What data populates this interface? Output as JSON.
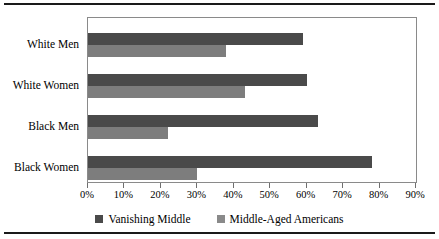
{
  "chart_data": {
    "type": "bar",
    "orientation": "horizontal",
    "title": "",
    "subtitle": "",
    "xlabel": "",
    "ylabel": "",
    "categories": [
      "White Men",
      "White Women",
      "Black Men",
      "Black Women"
    ],
    "series": [
      {
        "name": "Vanishing Middle",
        "color": "#4a4a4a",
        "values": [
          59,
          60,
          63,
          78
        ]
      },
      {
        "name": "Middle-Aged Americans",
        "color": "#7d7d7d",
        "values": [
          38,
          43,
          22,
          30
        ]
      }
    ],
    "xlim": [
      0,
      90
    ],
    "xticks": [
      0,
      10,
      20,
      30,
      40,
      50,
      60,
      70,
      80,
      90
    ],
    "xtick_labels": [
      "0%",
      "10%",
      "20%",
      "30%",
      "40%",
      "50%",
      "60%",
      "70%",
      "80%",
      "90%"
    ],
    "grid": false,
    "legend_position": "bottom",
    "legend": [
      {
        "label": "Vanishing Middle",
        "color": "#4a4a4a"
      },
      {
        "label": "Middle-Aged Americans",
        "color": "#8a8a8a"
      }
    ],
    "annotations": []
  }
}
